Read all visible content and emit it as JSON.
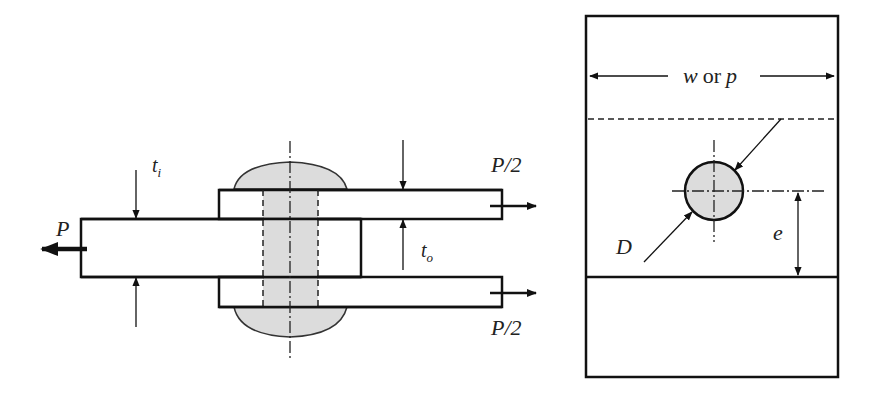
{
  "side_view": {
    "labels": {
      "load_left": "P",
      "load_top_right": "P/2",
      "load_bottom_right": "P/2",
      "inner_thickness": "t",
      "inner_thickness_sub": "i",
      "outer_thickness": "t",
      "outer_thickness_sub": "o"
    }
  },
  "plan_view": {
    "labels": {
      "width_var": "w",
      "width_or": "or",
      "width_pitch": "p",
      "diameter": "D",
      "edge_distance": "e"
    }
  },
  "colors": {
    "line": "#111111",
    "fastener_fill": "#dcdcdc",
    "background": "#ffffff"
  }
}
